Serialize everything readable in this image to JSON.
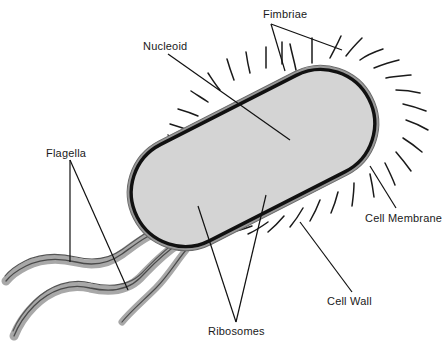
{
  "diagram": {
    "background_color": "#ffffff",
    "labels": [
      {
        "id": "fimbriae",
        "text": "Fimbriae",
        "x": 263,
        "y": 8,
        "leader_count": 2
      },
      {
        "id": "nucleoid",
        "text": "Nucleoid",
        "x": 143,
        "y": 40,
        "leader_count": 1
      },
      {
        "id": "flagella",
        "text": "Flagella",
        "x": 46,
        "y": 147,
        "leader_count": 2
      },
      {
        "id": "cell_membrane",
        "text": "Cell Membrane",
        "x": 365,
        "y": 212,
        "leader_count": 1
      },
      {
        "id": "cell_wall",
        "text": "Cell Wall",
        "x": 327,
        "y": 295,
        "leader_count": 1
      },
      {
        "id": "ribosomes",
        "text": "Ribosomes",
        "x": 208,
        "y": 325,
        "leader_count": 2
      }
    ],
    "colors": {
      "outline": "#111111",
      "membrane": "#111111",
      "cell_wall": "#8f8f8f",
      "cytoplasm": "#d4d4d4",
      "nucleoid_thread": "#6e6e6e",
      "nucleoid_thread_dark": "#2b2b2b",
      "ribosome_dot": "#3a3a3a",
      "flagella_fill": "#a8a8a8",
      "flagella_outline": "#4a4a4a",
      "fimbriae": "#1a1a1a",
      "label_text": "#1a1a1a",
      "leader_line": "#111111"
    },
    "parts": {
      "cell_body": {
        "shape": "capsule",
        "rotation_deg": -27,
        "length": 260,
        "width": 108
      },
      "fimbriae": {
        "description": "short thin hair-like projections around cell perimeter",
        "count": 26
      },
      "flagella": {
        "description": "two long thick wavy tails from lower-left pole",
        "count": 2
      },
      "nucleoid": {
        "description": "tangled looping DNA threads along cell long axis"
      },
      "ribosomes": {
        "description": "small dark dots scattered in cytoplasm",
        "count": 34
      }
    }
  }
}
